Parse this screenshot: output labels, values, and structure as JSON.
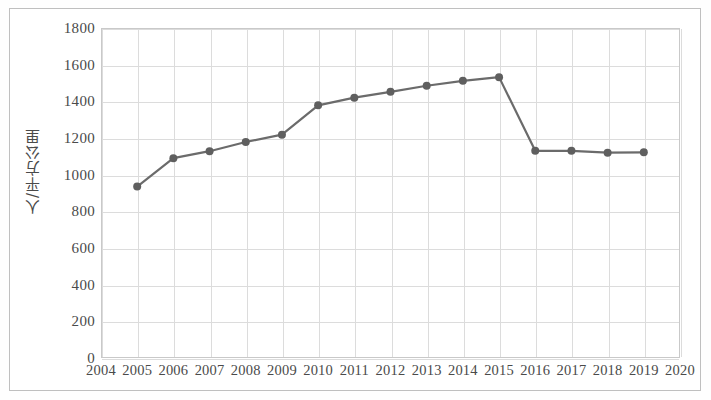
{
  "chart_data": {
    "type": "line",
    "title": "",
    "subtitle": "",
    "xlabel": "",
    "ylabel": "人/平方公里",
    "xlim": [
      2004,
      2020
    ],
    "ylim": [
      0,
      1800
    ],
    "ytick_step": 200,
    "grid": true,
    "legend": false,
    "legend_position": "none",
    "line_color": "#6b6b6b",
    "marker_color": "#5f5f5f",
    "marker_shape": "circle",
    "axis_tick_labels": {
      "y": [
        "1800",
        "1600",
        "1400",
        "1200",
        "1000",
        "800",
        "600",
        "400",
        "200",
        "0"
      ],
      "x": [
        "2004",
        "2005",
        "2006",
        "2007",
        "2008",
        "2009",
        "2010",
        "2011",
        "2012",
        "2013",
        "2014",
        "2015",
        "2016",
        "2017",
        "2018",
        "2019",
        "2020"
      ]
    },
    "categories": [
      2005,
      2006,
      2007,
      2008,
      2009,
      2010,
      2011,
      2012,
      2013,
      2014,
      2015,
      2016,
      2017,
      2018,
      2019
    ],
    "values": [
      935,
      1090,
      1128,
      1178,
      1218,
      1378,
      1420,
      1452,
      1485,
      1512,
      1532,
      1130,
      1130,
      1120,
      1122
    ],
    "series": [
      {
        "name": "人口密度",
        "x": [
          2005,
          2006,
          2007,
          2008,
          2009,
          2010,
          2011,
          2012,
          2013,
          2014,
          2015,
          2016,
          2017,
          2018,
          2019
        ],
        "values": [
          935,
          1090,
          1128,
          1178,
          1218,
          1378,
          1420,
          1452,
          1485,
          1512,
          1532,
          1130,
          1130,
          1120,
          1122
        ]
      }
    ],
    "annotations": []
  },
  "figure": {
    "background_color": "#ffffff",
    "frame_color": "#bfbfbf",
    "grid_color": "#dcdcdc",
    "text_color": "#4a4a4a"
  }
}
